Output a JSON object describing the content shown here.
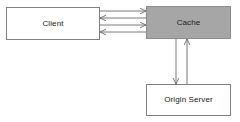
{
  "diagram": {
    "background_color": "#ffffff",
    "line_color": "#6b6b6b",
    "nodes": [
      {
        "id": "client",
        "label": "Client",
        "fill": "#ffffff",
        "stroke": "#808080",
        "x": 6,
        "y": 7,
        "width": 94,
        "height": 33
      },
      {
        "id": "cache",
        "label": "Cache",
        "fill": "#a6a6a6",
        "stroke": "#8c8c8c",
        "x": 146,
        "y": 6,
        "width": 85,
        "height": 33
      },
      {
        "id": "origin",
        "label": "Origin Server",
        "fill": "#ffffff",
        "stroke": "#808080",
        "x": 146,
        "y": 84,
        "width": 85,
        "height": 32
      }
    ],
    "edges": [
      {
        "id": "client-to-cache-1",
        "from": "client",
        "to": "cache",
        "direction": "right",
        "label": "",
        "x1": 100,
        "y1": 11,
        "x2": 146,
        "y2": 11
      },
      {
        "id": "cache-to-client-1",
        "from": "cache",
        "to": "client",
        "direction": "left",
        "label": "",
        "x1": 146,
        "y1": 18,
        "x2": 100,
        "y2": 18
      },
      {
        "id": "client-to-cache-2",
        "from": "client",
        "to": "cache",
        "direction": "right",
        "label": "",
        "x1": 100,
        "y1": 25,
        "x2": 146,
        "y2": 25
      },
      {
        "id": "cache-to-client-2",
        "from": "cache",
        "to": "client",
        "direction": "left",
        "label": "",
        "x1": 146,
        "y1": 32,
        "x2": 100,
        "y2": 32
      },
      {
        "id": "cache-to-origin",
        "from": "cache",
        "to": "origin",
        "direction": "down",
        "label": "",
        "x1": 176,
        "y1": 39,
        "x2": 176,
        "y2": 84
      },
      {
        "id": "origin-to-cache",
        "from": "origin",
        "to": "cache",
        "direction": "up",
        "label": "",
        "x1": 187,
        "y1": 84,
        "x2": 187,
        "y2": 39
      }
    ]
  }
}
